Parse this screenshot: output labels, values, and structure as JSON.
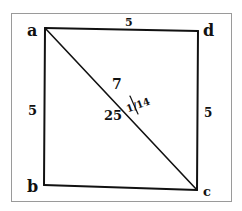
{
  "figure": {
    "type": "geometric-square-with-diagonal",
    "vertices": {
      "a": {
        "label": "a",
        "x": 45,
        "y": 28
      },
      "d": {
        "label": "d",
        "x": 198,
        "y": 31
      },
      "b": {
        "label": "b",
        "x": 44,
        "y": 185
      },
      "c": {
        "label": "c",
        "x": 197,
        "y": 190
      }
    },
    "side_labels": {
      "top": "5",
      "left": "5",
      "right": "5"
    },
    "diagonal_labels": {
      "upper": "7",
      "lower": "25",
      "fraction": "1/14"
    },
    "colors": {
      "ink": "#111111",
      "frame": "#9a9a9a",
      "background": "#ffffff"
    }
  }
}
